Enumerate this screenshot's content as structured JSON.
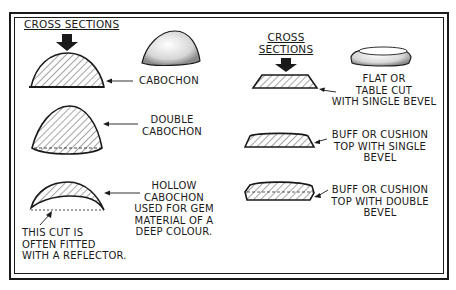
{
  "left_panel": {
    "heading": "CROSS SECTIONS",
    "items": [
      {
        "name": "cabochon",
        "label": [
          "CABOCHON"
        ]
      },
      {
        "name": "double-cabochon",
        "label": [
          "DOUBLE",
          "CABOCHON"
        ]
      },
      {
        "name": "hollow-cabochon",
        "label": [
          "HOLLOW",
          "CABOCHON",
          "USED FOR GEM",
          "MATERIAL OF A",
          "DEEP COLOUR."
        ],
        "note": [
          "THIS CUT IS",
          "OFTEN FITTED",
          "WITH A REFLECTOR."
        ]
      }
    ]
  },
  "right_panel": {
    "heading": [
      "CROSS",
      "SECTIONS"
    ],
    "items": [
      {
        "name": "flat-table-cut",
        "label": [
          "FLAT OR",
          "TABLE CUT",
          "WITH SINGLE BEVEL"
        ]
      },
      {
        "name": "buff-single-bevel",
        "label": [
          "BUFF OR CUSHION",
          "TOP WITH SINGLE",
          "BEVEL"
        ]
      },
      {
        "name": "buff-double-bevel",
        "label": [
          "BUFF OR CUSHION",
          "TOP WITH DOUBLE",
          "BEVEL"
        ]
      }
    ]
  },
  "colors": {
    "ink": "#1a1a1a",
    "paper": "#ffffff"
  }
}
